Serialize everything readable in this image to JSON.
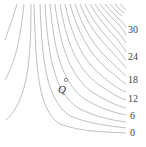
{
  "diagram": {
    "type": "contour-map",
    "point": {
      "label": "Q",
      "x": 66,
      "y": 80
    },
    "level_labels": [
      {
        "text": "30",
        "x": 128,
        "y": 33
      },
      {
        "text": "24",
        "x": 128,
        "y": 60
      },
      {
        "text": "18",
        "x": 128,
        "y": 83
      },
      {
        "text": "12",
        "x": 128,
        "y": 102
      },
      {
        "text": "6",
        "x": 130,
        "y": 119
      },
      {
        "text": "0",
        "x": 130,
        "y": 136
      }
    ],
    "colors": {
      "curve": "#b8b8b8",
      "text": "#444444",
      "background": "#ffffff"
    }
  }
}
